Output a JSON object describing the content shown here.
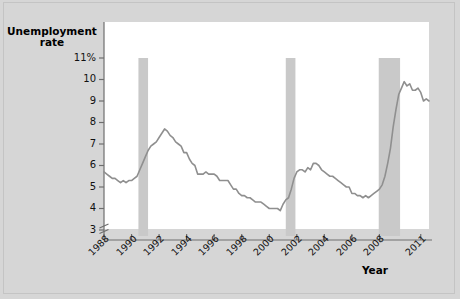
{
  "figure": {
    "background_color": "#d6d6d6",
    "plot_background_color": "#ffffff",
    "line_color": "#8f8f8f",
    "band_color": "#c9c9c9",
    "axis_color": "#6e6e6e"
  },
  "chart_data": {
    "type": "line",
    "title": "",
    "xlabel": "Year",
    "ylabel": "Unemployment rate",
    "ylabel_line1": "Unemployment",
    "ylabel_line2": "rate",
    "ytick_labels": [
      "11%",
      "10",
      "9",
      "8",
      "7",
      "6",
      "5",
      "4",
      "3"
    ],
    "ytick_values": [
      11,
      10,
      9,
      8,
      7,
      6,
      5,
      4,
      3
    ],
    "ylim": [
      3,
      11
    ],
    "y_axis_break": true,
    "xtick_labels": [
      "1988",
      "1990",
      "1992",
      "1994",
      "1996",
      "1998",
      "2000",
      "2002",
      "2004",
      "2006",
      "2008",
      "2011"
    ],
    "xtick_values": [
      1988,
      1990,
      1992,
      1994,
      1996,
      1998,
      2000,
      2002,
      2004,
      2006,
      2008,
      2011
    ],
    "xlim": [
      1988,
      2011.6
    ],
    "grid": false,
    "legend": null,
    "shaded_regions": [
      {
        "name": "recession-1990",
        "start": 1990.5,
        "end": 1991.2,
        "label": "recession"
      },
      {
        "name": "recession-2001",
        "start": 2001.2,
        "end": 2001.9,
        "label": "recession"
      },
      {
        "name": "recession-2008",
        "start": 2007.95,
        "end": 2009.5,
        "label": "recession"
      }
    ],
    "series": [
      {
        "name": "Unemployment rate",
        "color": "#8f8f8f",
        "x": [
          1988.0,
          1988.2,
          1988.4,
          1988.6,
          1988.8,
          1989.0,
          1989.2,
          1989.4,
          1989.6,
          1989.8,
          1990.0,
          1990.2,
          1990.4,
          1990.6,
          1990.8,
          1991.0,
          1991.2,
          1991.4,
          1991.6,
          1991.8,
          1992.0,
          1992.2,
          1992.4,
          1992.6,
          1992.8,
          1993.0,
          1993.2,
          1993.4,
          1993.6,
          1993.8,
          1994.0,
          1994.2,
          1994.4,
          1994.6,
          1994.8,
          1995.0,
          1995.2,
          1995.4,
          1995.6,
          1995.8,
          1996.0,
          1996.2,
          1996.4,
          1996.6,
          1996.8,
          1997.0,
          1997.2,
          1997.4,
          1997.6,
          1997.8,
          1998.0,
          1998.2,
          1998.4,
          1998.6,
          1998.8,
          1999.0,
          1999.2,
          1999.4,
          1999.6,
          1999.8,
          2000.0,
          2000.2,
          2000.4,
          2000.6,
          2000.8,
          2001.0,
          2001.2,
          2001.4,
          2001.6,
          2001.8,
          2002.0,
          2002.2,
          2002.4,
          2002.6,
          2002.8,
          2003.0,
          2003.2,
          2003.4,
          2003.6,
          2003.8,
          2004.0,
          2004.2,
          2004.4,
          2004.6,
          2004.8,
          2005.0,
          2005.2,
          2005.4,
          2005.6,
          2005.8,
          2006.0,
          2006.2,
          2006.4,
          2006.6,
          2006.8,
          2007.0,
          2007.2,
          2007.4,
          2007.6,
          2007.8,
          2008.0,
          2008.2,
          2008.4,
          2008.6,
          2008.8,
          2009.0,
          2009.2,
          2009.4,
          2009.6,
          2009.8,
          2010.0,
          2010.2,
          2010.4,
          2010.6,
          2010.8,
          2011.0,
          2011.2,
          2011.4,
          2011.6
        ],
        "y": [
          5.7,
          5.6,
          5.5,
          5.4,
          5.4,
          5.3,
          5.2,
          5.3,
          5.2,
          5.3,
          5.3,
          5.4,
          5.5,
          5.8,
          6.1,
          6.4,
          6.7,
          6.9,
          7.0,
          7.1,
          7.3,
          7.5,
          7.7,
          7.6,
          7.4,
          7.3,
          7.1,
          7.0,
          6.9,
          6.6,
          6.6,
          6.3,
          6.1,
          6.0,
          5.6,
          5.6,
          5.6,
          5.7,
          5.6,
          5.6,
          5.6,
          5.5,
          5.3,
          5.3,
          5.3,
          5.3,
          5.1,
          4.9,
          4.9,
          4.7,
          4.6,
          4.6,
          4.5,
          4.5,
          4.4,
          4.3,
          4.3,
          4.3,
          4.2,
          4.1,
          4.0,
          4.0,
          4.0,
          4.0,
          3.9,
          4.2,
          4.4,
          4.5,
          4.9,
          5.4,
          5.7,
          5.8,
          5.8,
          5.7,
          5.9,
          5.8,
          6.1,
          6.1,
          6.0,
          5.8,
          5.7,
          5.6,
          5.5,
          5.5,
          5.4,
          5.3,
          5.2,
          5.1,
          5.0,
          5.0,
          4.7,
          4.7,
          4.6,
          4.6,
          4.5,
          4.6,
          4.5,
          4.6,
          4.7,
          4.8,
          4.9,
          5.1,
          5.5,
          6.1,
          6.8,
          7.8,
          8.6,
          9.3,
          9.6,
          9.9,
          9.7,
          9.8,
          9.5,
          9.5,
          9.6,
          9.4,
          9.0,
          9.1,
          9.0
        ]
      }
    ]
  }
}
